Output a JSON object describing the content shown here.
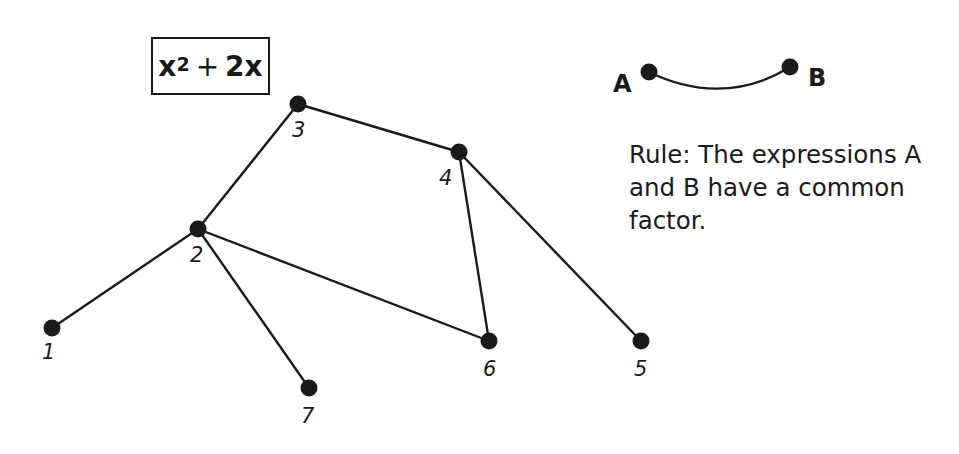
{
  "expression_box": {
    "base": "x",
    "exponent": "2",
    "operator": "+",
    "term": "2x"
  },
  "legend": {
    "endpoint_a": "A",
    "endpoint_b": "B"
  },
  "rule_text": "Rule: The expressions A and B have a common factor.",
  "graph": {
    "nodes": [
      {
        "id": "1",
        "label": "1",
        "x": 52,
        "y": 328
      },
      {
        "id": "2",
        "label": "2",
        "x": 198,
        "y": 229
      },
      {
        "id": "3",
        "label": "3",
        "x": 298,
        "y": 104
      },
      {
        "id": "4",
        "label": "4",
        "x": 459,
        "y": 152
      },
      {
        "id": "5",
        "label": "5",
        "x": 641,
        "y": 341
      },
      {
        "id": "6",
        "label": "6",
        "x": 489,
        "y": 341
      },
      {
        "id": "7",
        "label": "7",
        "x": 309,
        "y": 388
      }
    ],
    "edges": [
      [
        "1",
        "2"
      ],
      [
        "2",
        "3"
      ],
      [
        "3",
        "4"
      ],
      [
        "2",
        "6"
      ],
      [
        "2",
        "7"
      ],
      [
        "4",
        "6"
      ],
      [
        "4",
        "5"
      ]
    ]
  },
  "colors": {
    "ink": "#1a1a1a",
    "background": "#ffffff"
  }
}
